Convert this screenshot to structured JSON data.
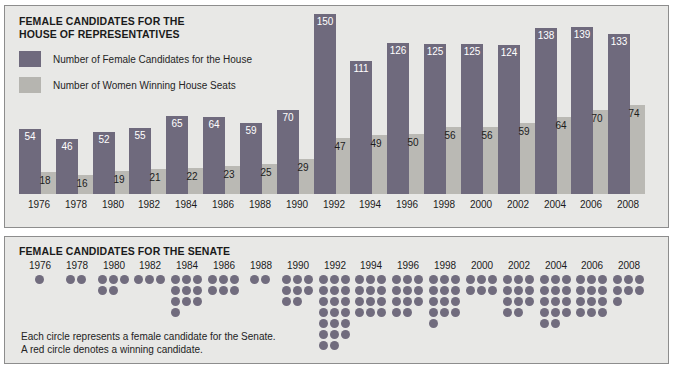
{
  "house": {
    "title": "FEMALE CANDIDATES FOR THE\nHOUSE OF REPRESENTATIVES",
    "legend": [
      {
        "swatch": "dark",
        "label": "Number of Female Candidates for the House"
      },
      {
        "swatch": "light",
        "label": "Number of Women Winning House Seats"
      }
    ]
  },
  "senate": {
    "title": "FEMALE CANDIDATES FOR THE SENATE",
    "caption": "Each circle represents a female candidate for the Senate.\nA red circle denotes a winning candidate."
  },
  "colors": {
    "bar_candidates": "#6f6a7d",
    "bar_winners": "#bab9b4",
    "dot_candidate": "#716c7e",
    "dot_winner": "#8e4a52",
    "panel_background": "#e8e8e6",
    "panel_border": "#8d8d8d",
    "page_background": "#ffffff",
    "text": "#1c1c1c",
    "value_on_dark": "#ffffff"
  },
  "chart_data": [
    {
      "type": "bar",
      "title": "FEMALE CANDIDATES FOR THE HOUSE OF REPRESENTATIVES",
      "xlabel": "",
      "ylabel": "",
      "ylim": [
        0,
        150
      ],
      "grid": false,
      "legend_position": "top-left",
      "categories": [
        "1976",
        "1978",
        "1980",
        "1982",
        "1984",
        "1986",
        "1988",
        "1990",
        "1992",
        "1994",
        "1996",
        "1998",
        "2000",
        "2002",
        "2004",
        "2006",
        "2008"
      ],
      "series": [
        {
          "name": "Number of Female Candidates for the House",
          "color": "#6f6a7d",
          "values": [
            54,
            46,
            52,
            55,
            65,
            64,
            59,
            70,
            150,
            111,
            126,
            125,
            125,
            124,
            138,
            139,
            133
          ]
        },
        {
          "name": "Number of Women Winning House Seats",
          "color": "#bab9b4",
          "values": [
            18,
            16,
            19,
            21,
            22,
            23,
            25,
            29,
            47,
            49,
            50,
            56,
            56,
            59,
            64,
            70,
            74
          ]
        }
      ]
    },
    {
      "type": "scatter",
      "title": "FEMALE CANDIDATES FOR THE SENATE",
      "xlabel": "",
      "ylabel": "",
      "grid": false,
      "legend_position": "none",
      "note": "Each circle represents a female candidate for the Senate. A red circle denotes a winning candidate.",
      "categories": [
        "1976",
        "1978",
        "1980",
        "1982",
        "1984",
        "1986",
        "1988",
        "1990",
        "1992",
        "1994",
        "1996",
        "1998",
        "2000",
        "2002",
        "2004",
        "2006",
        "2008"
      ],
      "series": [
        {
          "name": "Number of Female Candidates for the Senate",
          "color": "#716c7e",
          "values": [
            1,
            2,
            5,
            3,
            10,
            6,
            2,
            8,
            20,
            12,
            11,
            13,
            6,
            11,
            14,
            12,
            7
          ]
        }
      ]
    }
  ]
}
